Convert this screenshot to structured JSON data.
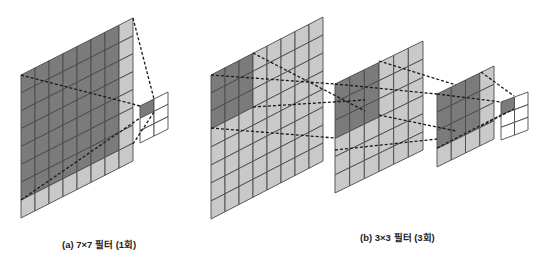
{
  "colors": {
    "dark": "#7b7b7b",
    "light": "#c9c9c9",
    "empty": "#ffffff",
    "grid_line": "#4a4a4a",
    "dash_line": "#1a1a1a"
  },
  "panels": [
    {
      "id": "a",
      "caption": "(a) 7×7 필터 (1회)",
      "caption_pos": [
        62,
        239
      ],
      "grids": [
        {
          "name": "input-7x7",
          "x0": 21,
          "yTopLeft": 75,
          "yBotLeft": 218,
          "x1": 133,
          "yTopRight": 18,
          "cols": 8,
          "rows": 8,
          "darkCols": 7,
          "darkRows": 7,
          "fill": "light"
        },
        {
          "name": "output",
          "x0": 140,
          "yTopLeft": 106,
          "yBotLeft": 143,
          "x1": 168,
          "yTopRight": 92,
          "cols": 2,
          "rows": 3,
          "darkCols": 1,
          "darkRows": 1,
          "fill": "empty"
        }
      ],
      "connections": [
        {
          "from": [
            133,
            18
          ],
          "to": [
            154,
            99
          ]
        },
        {
          "from": [
            21,
            75
          ],
          "to": [
            140,
            106
          ]
        },
        {
          "from": [
            21,
            200
          ],
          "to": [
            140,
            118
          ]
        },
        {
          "from": [
            133,
            144
          ],
          "to": [
            154,
            112
          ]
        }
      ]
    },
    {
      "id": "b",
      "caption": "(b) 3×3 필터 (3회)",
      "caption_pos": [
        360,
        232
      ],
      "grids": [
        {
          "name": "input-7x7",
          "x0": 211,
          "yTopLeft": 75,
          "yBotLeft": 219,
          "x1": 323,
          "yTopRight": 17,
          "cols": 8,
          "rows": 8,
          "darkCols": 3,
          "darkRows": 3,
          "fill": "light"
        },
        {
          "name": "intermediate-5x5",
          "x0": 335,
          "yTopLeft": 84,
          "yBotLeft": 193,
          "x1": 423,
          "yTopRight": 41,
          "cols": 6,
          "rows": 6,
          "darkCols": 3,
          "darkRows": 3,
          "fill": "light"
        },
        {
          "name": "intermediate-3x3",
          "x0": 437,
          "yTopLeft": 94,
          "yBotLeft": 167,
          "x1": 494,
          "yTopRight": 66,
          "cols": 4,
          "rows": 4,
          "darkCols": 3,
          "darkRows": 3,
          "fill": "light"
        },
        {
          "name": "output",
          "x0": 501,
          "yTopLeft": 102,
          "yBotLeft": 140,
          "x1": 528,
          "yTopRight": 92,
          "cols": 2,
          "rows": 3,
          "darkCols": 1,
          "darkRows": 1,
          "fill": "empty"
        }
      ],
      "connections": [
        {
          "from": [
            253,
            53
          ],
          "to": [
            365,
            111
          ]
        },
        {
          "from": [
            211,
            75
          ],
          "to": [
            335,
            84
          ]
        },
        {
          "from": [
            211,
            128
          ],
          "to": [
            335,
            138
          ]
        },
        {
          "from": [
            253,
            107
          ],
          "to": [
            365,
            100
          ]
        },
        {
          "from": [
            379,
            61
          ],
          "to": [
            456,
            85
          ]
        },
        {
          "from": [
            335,
            84
          ],
          "to": [
            437,
            94
          ]
        },
        {
          "from": [
            335,
            150
          ],
          "to": [
            437,
            139
          ]
        },
        {
          "from": [
            379,
            115
          ],
          "to": [
            456,
            131
          ]
        },
        {
          "from": [
            481,
            72
          ],
          "to": [
            514,
            96
          ]
        },
        {
          "from": [
            437,
            94
          ],
          "to": [
            501,
            102
          ]
        },
        {
          "from": [
            437,
            148
          ],
          "to": [
            501,
            115
          ]
        },
        {
          "from": [
            481,
            126
          ],
          "to": [
            514,
            109
          ]
        }
      ]
    }
  ]
}
